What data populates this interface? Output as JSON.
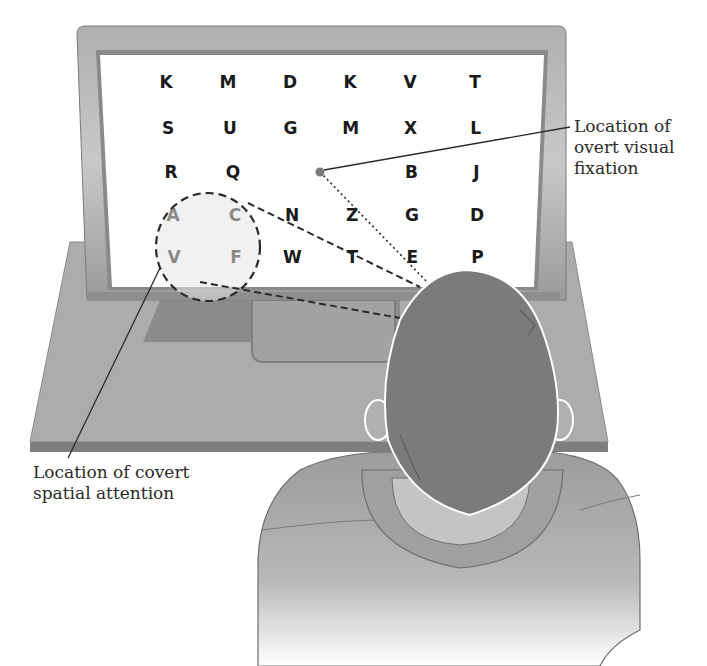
{
  "diagram": {
    "letter_grid": {
      "rows": [
        [
          "K",
          "M",
          "D",
          "K",
          "V",
          "T"
        ],
        [
          "S",
          "U",
          "G",
          "M",
          "X",
          "L"
        ],
        [
          "R",
          "Q",
          "",
          "",
          "B",
          "J"
        ],
        [
          "A",
          "C",
          "N",
          "Z",
          "G",
          "D"
        ],
        [
          "V",
          "F",
          "W",
          "T",
          "E",
          "P"
        ]
      ]
    },
    "labels": {
      "fixation": "Location of\novert visual\nfixation",
      "covert": "Location of covert\nspatial attention"
    },
    "colors": {
      "monitor_frame": "#9a9a9a",
      "screen": "#ffffff",
      "desk": "#a8a8a8",
      "desk_edge": "#7e7e7e",
      "hair": "#7a7a7a",
      "shirt": "#a5a5a5",
      "collar": "#bdbdbd",
      "fixation_dot": "#7a7a7a"
    }
  }
}
